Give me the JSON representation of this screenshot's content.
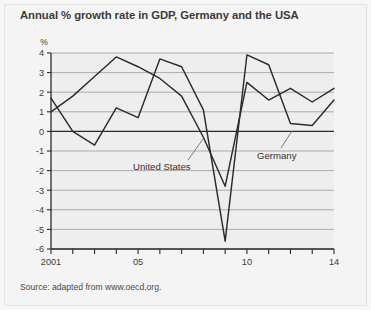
{
  "chart_title": "Annual % growth rate in GDP, Germany and the USA",
  "source_note": "Source: adapted from www.oecd.org.",
  "axis": {
    "y_unit_label": "%",
    "y_ticks": [
      "4",
      "3",
      "2",
      "1",
      "0",
      "-1",
      "-2",
      "-3",
      "-4",
      "-5",
      "-6"
    ],
    "x_ticks_labeled": [
      "2001",
      "05",
      "10",
      "14"
    ]
  },
  "labels": {
    "united_states": "United States",
    "germany": "Germany"
  },
  "colors": {
    "plot_background": "#eeeeee",
    "figure_background": "#f4f4f4",
    "line": "#2b2b2b",
    "gridline": "#9a9a9a",
    "axis": "#2b2b2b",
    "text": "#3c3c3c"
  },
  "chart_data": {
    "type": "line",
    "title": "Annual % growth rate in GDP, Germany and the USA",
    "xlabel": "",
    "ylabel": "%",
    "ylim": [
      -6,
      4
    ],
    "xlim": [
      2001,
      2014
    ],
    "grid": true,
    "legend": "inline-annotations",
    "x": [
      2001,
      2002,
      2003,
      2004,
      2005,
      2006,
      2007,
      2008,
      2009,
      2010,
      2011,
      2012,
      2013,
      2014
    ],
    "series": [
      {
        "name": "United States",
        "values": [
          1.0,
          1.8,
          2.8,
          3.8,
          3.3,
          2.7,
          1.8,
          -0.3,
          -2.8,
          2.5,
          1.6,
          2.2,
          1.5,
          2.2
        ]
      },
      {
        "name": "Germany",
        "values": [
          1.7,
          0.0,
          -0.7,
          1.2,
          0.7,
          3.7,
          3.3,
          1.1,
          -5.6,
          3.9,
          3.4,
          0.4,
          0.3,
          1.6
        ]
      }
    ]
  }
}
